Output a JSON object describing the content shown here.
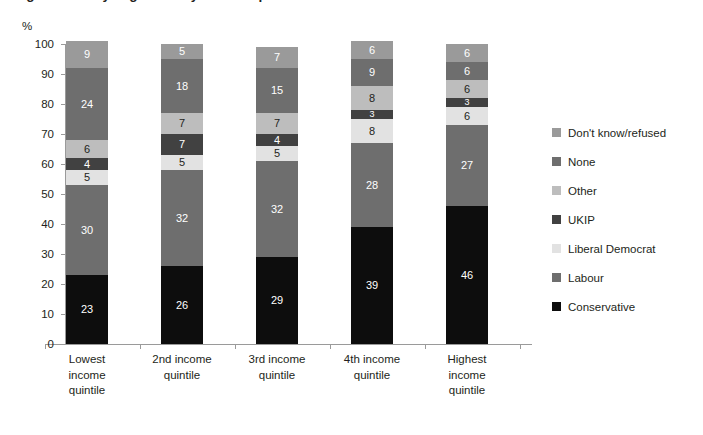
{
  "chart": {
    "title": "Figure 5: Party alignment by income quintile",
    "axis_unit": "%",
    "ylabel": "",
    "xlabel": ""
  },
  "chart_data": {
    "type": "bar",
    "subtype": "stacked-bar-100",
    "title": "Figure 5: Party alignment by income quintile",
    "xlabel": "",
    "ylabel": "%",
    "ylim": [
      0,
      100
    ],
    "ytick_step": 10,
    "grid": false,
    "legend_position": "right",
    "yticks": [
      "0",
      "10",
      "20",
      "30",
      "40",
      "50",
      "60",
      "70",
      "80",
      "90",
      "100"
    ],
    "categories": [
      "Lowest income quintile",
      "2nd income quintile",
      "3rd income quintile",
      "4th income quintile",
      "Highest income quintile"
    ],
    "category_label_lines": [
      [
        "Lowest",
        "income",
        "quintile"
      ],
      [
        "2nd income",
        "quintile"
      ],
      [
        "3rd income",
        "quintile"
      ],
      [
        "4th income",
        "quintile"
      ],
      [
        "Highest",
        "income",
        "quintile"
      ]
    ],
    "series": [
      {
        "name": "Conservative",
        "color": "#0d0d0d",
        "label_color": "#ffffff",
        "values": [
          23,
          26,
          29,
          39,
          46
        ]
      },
      {
        "name": "Labour",
        "color": "#6e6e6e",
        "label_color": "#ffffff",
        "values": [
          30,
          32,
          32,
          28,
          27
        ]
      },
      {
        "name": "Liberal Democrat",
        "color": "#e2e2e2",
        "label_color": "#231f20",
        "values": [
          5,
          5,
          5,
          8,
          6
        ]
      },
      {
        "name": "UKIP",
        "color": "#414141",
        "label_color": "#ffffff",
        "values": [
          4,
          7,
          4,
          3,
          3
        ]
      },
      {
        "name": "Other",
        "color": "#bdbdbd",
        "label_color": "#231f20",
        "values": [
          6,
          7,
          7,
          8,
          6
        ]
      },
      {
        "name": "None",
        "color": "#6e6e6e",
        "label_color": "#ffffff",
        "values": [
          24,
          18,
          15,
          9,
          6
        ]
      },
      {
        "name": "Don't know/refused",
        "color": "#9a9a9a",
        "label_color": "#ffffff",
        "values": [
          9,
          5,
          7,
          6,
          6
        ]
      }
    ],
    "legend_order_top_to_bottom": [
      "Don't know/refused",
      "None",
      "Other",
      "UKIP",
      "Liberal Democrat",
      "Labour",
      "Conservative"
    ]
  }
}
